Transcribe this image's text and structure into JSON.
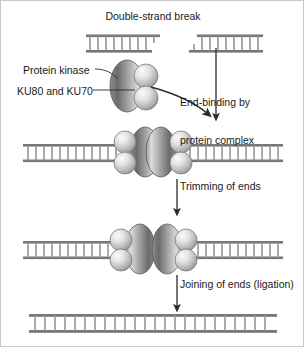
{
  "figure": {
    "title": "Double-strand break",
    "background_color": "#ffffff",
    "border_color": "#c8c8c8",
    "width": 304,
    "height": 347
  },
  "labels": {
    "protein_kinase": "Protein kinase",
    "ku_subunits": "KU80 and KU70"
  },
  "steps": [
    {
      "id": "end-binding",
      "line1": "End-binding by",
      "line2": "protein complex"
    },
    {
      "id": "trimming",
      "line1": "Trimming of ends",
      "line2": ""
    },
    {
      "id": "ligation",
      "line1": "Joining of ends (ligation)",
      "line2": ""
    }
  ],
  "colors": {
    "dna_strand": "#767676",
    "dna_rung": "#8f8f8f",
    "ellipse_dark": "#6e6e6e",
    "ellipse_light": "#d2d2d2",
    "sphere_dark": "#9e9e9e",
    "sphere_light": "#f2f2f2",
    "outline": "#4a4a4a",
    "arrow": "#2b2b2b",
    "text": "#1a1a1a"
  },
  "diagram": {
    "stage1": {
      "name": "broken-dna",
      "left_fragment": {
        "x": 85,
        "y": 34,
        "width": 72,
        "rungs": 7,
        "overhang": "3-prime-right"
      },
      "right_fragment": {
        "x": 190,
        "y": 34,
        "width": 72,
        "rungs": 7,
        "overhang": "5-prime-left"
      }
    },
    "stage2": {
      "name": "complexes-bound-at-ends",
      "left_dna": {
        "x": 22,
        "y": 143,
        "width": 100,
        "rungs": 10
      },
      "right_dna": {
        "x": 182,
        "y": 143,
        "width": 100,
        "rungs": 10
      },
      "left_complex": {
        "cx": 140,
        "cy": 146,
        "facing": "right"
      },
      "right_complex": {
        "cx": 164,
        "cy": 146,
        "facing": "left"
      }
    },
    "stage3": {
      "name": "ends-trimmed-complexes-apart",
      "left_dna": {
        "x": 22,
        "y": 240,
        "width": 95,
        "rungs": 9
      },
      "right_dna": {
        "x": 187,
        "y": 240,
        "width": 95,
        "rungs": 9
      },
      "left_complex": {
        "cx": 132,
        "cy": 243,
        "facing": "left"
      },
      "right_complex": {
        "cx": 172,
        "cy": 243,
        "facing": "right"
      }
    },
    "stage4": {
      "name": "repaired-dna",
      "dna": {
        "x": 28,
        "y": 313,
        "width": 248,
        "rungs": 24
      }
    },
    "arrows": [
      {
        "id": "arrow-curved-binding",
        "type": "curved",
        "from": [
          152,
          88
        ],
        "to": [
          215,
          115
        ]
      },
      {
        "id": "arrow-straight-binding",
        "type": "straight",
        "x": 215,
        "from_y": 48,
        "to_y": 118
      },
      {
        "id": "arrow-trimming",
        "type": "straight",
        "x": 176,
        "from_y": 172,
        "to_y": 212
      },
      {
        "id": "arrow-ligation",
        "type": "straight",
        "x": 176,
        "from_y": 270,
        "to_y": 308
      }
    ]
  }
}
